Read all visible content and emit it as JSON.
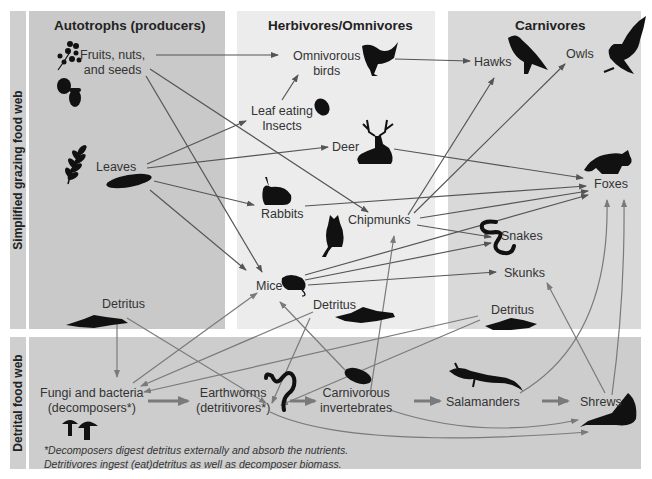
{
  "diagram": {
    "row_labels": {
      "grazing": "Simplified grazing food web",
      "detrital": "Detrital food web"
    },
    "columns": [
      {
        "id": "autotrophs",
        "title": "Autotrophs (producers)"
      },
      {
        "id": "herbivores",
        "title": "Herbivores/Omnivores"
      },
      {
        "id": "carnivores",
        "title": "Carnivores"
      }
    ],
    "nodes": {
      "fruits": {
        "line1": "Fruits, nuts,",
        "line2": "and seeds"
      },
      "leaves": "Leaves",
      "detritus_autotroph": "Detritus",
      "omnivorous_birds": {
        "line1": "Omnivorous",
        "line2": "birds"
      },
      "leaf_insects": {
        "line1": "Leaf eating",
        "line2": "Insects"
      },
      "deer": "Deer",
      "rabbits": "Rabbits",
      "chipmunks": "Chipmunks",
      "mice": "Mice",
      "detritus_herbivore": "Detritus",
      "hawks": "Hawks",
      "owls": "Owls",
      "foxes": "Foxes",
      "snakes": "Snakes",
      "skunks": "Skunks",
      "detritus_carnivore": "Detritus",
      "fungi": {
        "line1": "Fungi and bacteria",
        "line2": "(decomposers*)"
      },
      "earthworms": {
        "line1": "Earthworms",
        "line2": "(detritivores*)"
      },
      "carnivorous_invertebrates": {
        "line1": "Carnivorous",
        "line2": "invertebrates"
      },
      "salamanders": "Salamanders",
      "shrews": "Shrews"
    },
    "footnote": {
      "line1": "*Decomposers digest detritus externally and absorb the nutrients.",
      "line2": "Detritivores ingest (eat)detritus as well as decomposer biomass."
    },
    "edges": [
      [
        "Fruits, nuts, and seeds",
        "Omnivorous birds"
      ],
      [
        "Fruits, nuts, and seeds",
        "Chipmunks"
      ],
      [
        "Fruits, nuts, and seeds",
        "Mice"
      ],
      [
        "Leaves",
        "Leaf eating Insects"
      ],
      [
        "Leaves",
        "Deer"
      ],
      [
        "Leaves",
        "Rabbits"
      ],
      [
        "Leaves",
        "Mice"
      ],
      [
        "Leaf eating Insects",
        "Omnivorous birds"
      ],
      [
        "Omnivorous birds",
        "Hawks"
      ],
      [
        "Deer",
        "Foxes"
      ],
      [
        "Rabbits",
        "Foxes"
      ],
      [
        "Chipmunks",
        "Hawks"
      ],
      [
        "Chipmunks",
        "Owls"
      ],
      [
        "Chipmunks",
        "Foxes"
      ],
      [
        "Chipmunks",
        "Snakes"
      ],
      [
        "Mice",
        "Snakes"
      ],
      [
        "Mice",
        "Skunks"
      ],
      [
        "Mice",
        "Foxes"
      ],
      [
        "Detritus",
        "Fungi and bacteria"
      ],
      [
        "Detritus",
        "Earthworms"
      ],
      [
        "Fungi and bacteria",
        "Mice"
      ],
      [
        "Fungi and bacteria",
        "Earthworms"
      ],
      [
        "Earthworms",
        "Carnivorous invertebrates"
      ],
      [
        "Earthworms",
        "Shrews"
      ],
      [
        "Carnivorous invertebrates",
        "Salamanders"
      ],
      [
        "Carnivorous invertebrates",
        "Chipmunks"
      ],
      [
        "Carnivorous invertebrates",
        "Mice"
      ],
      [
        "Carnivorous invertebrates",
        "Shrews"
      ],
      [
        "Salamanders",
        "Shrews"
      ],
      [
        "Salamanders",
        "Foxes"
      ],
      [
        "Shrews",
        "Foxes"
      ],
      [
        "Shrews",
        "Skunks"
      ]
    ],
    "colors": {
      "autotroph_panel": "#c9c9c9",
      "herbivore_panel": "#ececec",
      "carnivore_panel": "#d9d9d9",
      "detrital_panel": "#cdcdcd",
      "side_label": "#cfcfcf",
      "grazing_arrow": "#555555",
      "detrital_arrow": "#7a7a7a"
    }
  }
}
